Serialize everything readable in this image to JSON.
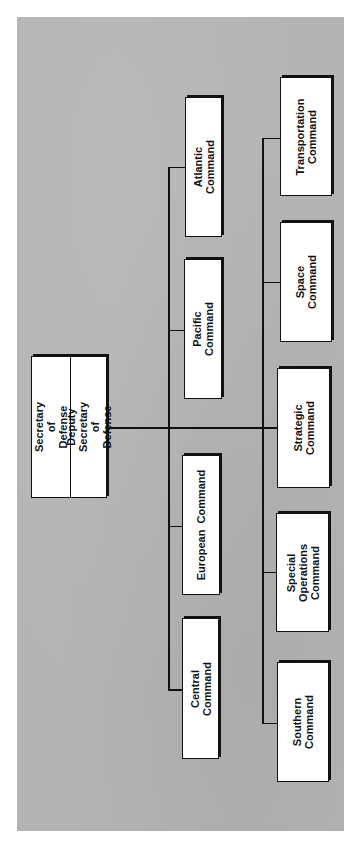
{
  "diagram": {
    "type": "org-chart",
    "orientation": "rotated-90",
    "root": {
      "title": "Secretary of\nDefense",
      "subtitle": "Deputy Secretary\nof Defense"
    },
    "upper_branch": [
      {
        "label": "Atlantic Command"
      },
      {
        "label": "Pacific Command"
      },
      {
        "label": "European  Command"
      },
      {
        "label": "Central Command"
      }
    ],
    "lower_branch": [
      {
        "label": "Transportation\nCommand"
      },
      {
        "label": "Space Command"
      },
      {
        "label": "Strategic\nCommand"
      },
      {
        "label": "Special Operations\nCommand"
      },
      {
        "label": "Southern\nCommand"
      }
    ],
    "colors": {
      "background": "#b4b4b4",
      "box_fill": "#ffffff",
      "line": "#111111"
    }
  }
}
